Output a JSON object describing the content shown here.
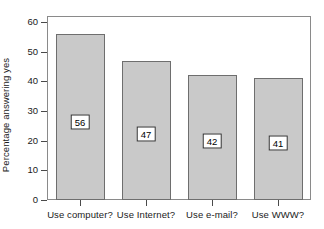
{
  "chart_data": {
    "type": "bar",
    "title": "",
    "xlabel": "",
    "ylabel": "Percentage answering yes",
    "categories": [
      "Use computer?",
      "Use Internet?",
      "Use e-mail?",
      "Use WWW?"
    ],
    "values": [
      56,
      47,
      42,
      41
    ],
    "value_labels": [
      "56",
      "47",
      "42",
      "41"
    ],
    "ylim": [
      0,
      62
    ],
    "yticks": [
      0,
      10,
      20,
      30,
      40,
      50,
      60
    ],
    "ytick_labels": [
      "0",
      "10",
      "20",
      "30",
      "40",
      "50",
      "60"
    ],
    "grid": false,
    "legend": false,
    "bar_color": "#c9c9c9",
    "bar_edge_color": "#6e6e6e",
    "frame_color": "#8a8a8a",
    "text_color": "#1a1a1a",
    "background": "#ffffff"
  }
}
